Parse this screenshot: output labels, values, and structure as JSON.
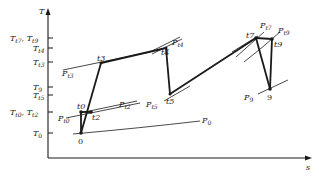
{
  "diagram": {
    "axes": {
      "y_label": "T",
      "x_label": "s"
    },
    "y_ticks": [
      {
        "label": "T",
        "sub": "t7",
        "label2": "T",
        "sub2": "t9",
        "y": 38
      },
      {
        "label": "T",
        "sub": "t4",
        "y": 48
      },
      {
        "label": "T",
        "sub": "t3",
        "y": 62
      },
      {
        "label": "T",
        "sub": "9",
        "y": 87
      },
      {
        "label": "T",
        "sub": "t5",
        "y": 95
      },
      {
        "label": "T",
        "sub": "t0",
        "label2": "T",
        "sub2": "t2",
        "y": 112
      },
      {
        "label": "T",
        "sub": "0",
        "y": 133
      }
    ],
    "states": [
      {
        "name": "0",
        "x": 81,
        "y": 133
      },
      {
        "name": "t0",
        "x": 81,
        "y": 112
      },
      {
        "name": "t2",
        "x": 91,
        "y": 112
      },
      {
        "name": "t3",
        "x": 101,
        "y": 63
      },
      {
        "name": "t4",
        "x": 166,
        "y": 48
      },
      {
        "name": "t5",
        "x": 170,
        "y": 94
      },
      {
        "name": "t7",
        "x": 256,
        "y": 38
      },
      {
        "name": "t9",
        "x": 272,
        "y": 39
      },
      {
        "name": "9",
        "x": 270,
        "y": 89
      }
    ],
    "isobars": [
      {
        "label": "P",
        "sub": "0"
      },
      {
        "label": "P",
        "sub": "t0"
      },
      {
        "label": "P",
        "sub": "t2"
      },
      {
        "label": "P",
        "sub": "t3"
      },
      {
        "label": "P",
        "sub": "t4"
      },
      {
        "label": "P",
        "sub": "t5"
      },
      {
        "label": "P",
        "sub": "t7"
      },
      {
        "label": "P",
        "sub": "t9"
      },
      {
        "label": "P",
        "sub": "9"
      }
    ],
    "point_labels": {
      "p0": "0",
      "pt0": "t0",
      "pt2": "t2",
      "pt3": "t3",
      "pt4": "t4",
      "pt5": "t5",
      "pt7": "t7",
      "pt9": "t9",
      "p9": "9"
    }
  }
}
